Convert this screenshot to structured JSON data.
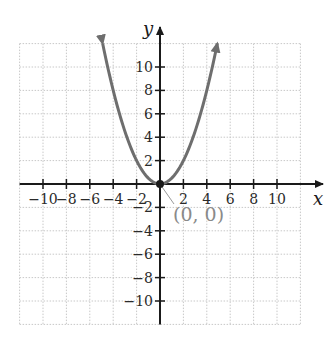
{
  "chart_data": {
    "type": "line",
    "title": "",
    "xlabel": "x",
    "ylabel": "y",
    "xlim": [
      -12,
      12
    ],
    "ylim": [
      -12,
      12
    ],
    "grid": true,
    "grid_step": 2,
    "x_ticks": [
      -10,
      -8,
      -6,
      -4,
      -2,
      2,
      4,
      6,
      8,
      10
    ],
    "y_ticks": [
      -10,
      -8,
      -6,
      -4,
      -2,
      2,
      4,
      6,
      8,
      10
    ],
    "x_tick_labels": [
      "−10",
      "−8",
      "−6",
      "−4",
      "−2",
      "2",
      "4",
      "6",
      "8",
      "10"
    ],
    "y_tick_labels": [
      "−10",
      "−8",
      "−6",
      "−4",
      "−2",
      "2",
      "4",
      "6",
      "8",
      "10"
    ],
    "series": [
      {
        "name": "y = x²/2",
        "equation": "y = 0.5x^2",
        "color": "#6e6e6e",
        "x": [
          -4.9,
          -4,
          -3,
          -2,
          -1,
          0,
          1,
          2,
          3,
          4,
          4.9
        ],
        "y": [
          12.0,
          8,
          4.5,
          2,
          0.5,
          0,
          0.5,
          2,
          4.5,
          8,
          12.0
        ],
        "arrows_at_ends": true
      }
    ],
    "annotations": [
      {
        "text": "(0, 0)",
        "x": 0,
        "y": 0,
        "color": "#8a8a8a",
        "marker": "dot"
      }
    ]
  },
  "labels": {
    "x_axis": "x",
    "y_axis": "y",
    "vertex": "(0, 0)"
  },
  "colors": {
    "axis": "#1a1a1a",
    "grid": "#c8c8c8",
    "curve": "#6e6e6e",
    "annotation": "#8a8a8a"
  }
}
